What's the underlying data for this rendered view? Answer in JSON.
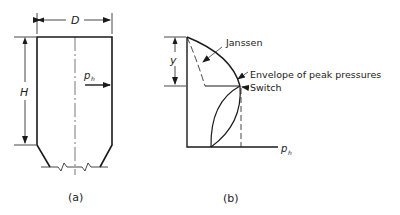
{
  "figure_a": {
    "caption": "(a)",
    "dimension_width": "D",
    "dimension_height": "H",
    "pressure_label": "p",
    "pressure_subscript": "h"
  },
  "figure_b": {
    "caption": "(b)",
    "dimension_depth": "y",
    "axis_label": "p",
    "axis_subscript": "h",
    "labels": {
      "janssen": "Janssen",
      "envelope": "Envelope of peak pressures",
      "switch": "Switch"
    }
  },
  "colors": {
    "line": "#1a1a1a",
    "background": "#ffffff"
  }
}
